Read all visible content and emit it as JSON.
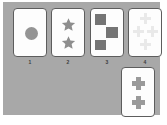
{
  "panel": {
    "background_color": "#a8a8a8",
    "page_background_color": "#ffffff"
  },
  "cards": [
    {
      "label": "1",
      "shape": "circle",
      "count": 1,
      "shape_color": "#949494",
      "card_color": "#fdfdfd",
      "border_color": "#5d5d5d",
      "arrangement": "single-center"
    },
    {
      "label": "2",
      "shape": "star",
      "count": 2,
      "shape_color": "#8e8e8e",
      "card_color": "#fdfdfd",
      "border_color": "#5d5d5d",
      "arrangement": "vertical-pair"
    },
    {
      "label": "3",
      "shape": "square",
      "count": 3,
      "shape_color": "#757575",
      "card_color": "#fdfdfd",
      "border_color": "#5d5d5d",
      "arrangement": "staircase"
    },
    {
      "label": "4",
      "shape": "cross",
      "count": 4,
      "shape_color": "#e9e9e9",
      "card_color": "#fdfdfd",
      "border_color": "#5d5d5d",
      "arrangement": "diamond"
    }
  ],
  "answer_card": {
    "shape": "cross",
    "count": 2,
    "shape_color": "#9a9a9a",
    "card_color": "#fdfdfd",
    "border_color": "#5d5d5d",
    "arrangement": "vertical-pair"
  }
}
